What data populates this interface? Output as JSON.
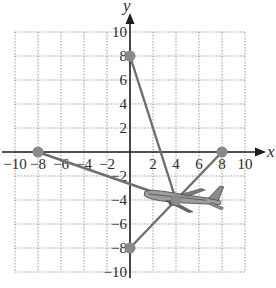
{
  "chart_data": {
    "type": "scatter",
    "title": "",
    "xlabel": "x",
    "ylabel": "y",
    "xlim": [
      -10,
      10
    ],
    "ylim": [
      -10,
      10
    ],
    "grid": true,
    "x_ticks": [
      -10,
      -8,
      -6,
      -4,
      -2,
      2,
      4,
      6,
      8,
      10
    ],
    "y_ticks": [
      10,
      8,
      6,
      4,
      2,
      -2,
      -4,
      -6,
      -8,
      -10
    ],
    "x_tick_labels": [
      "-10",
      "-8",
      "-6",
      "-4",
      "-2",
      "2",
      "4",
      "6",
      "8",
      "10"
    ],
    "y_tick_labels": [
      "10",
      "8",
      "6",
      "4",
      "2",
      "-2",
      "-4",
      "-6",
      "-8",
      "-10"
    ],
    "points": [
      {
        "x": 0,
        "y": 8
      },
      {
        "x": -8,
        "y": 0
      },
      {
        "x": 8,
        "y": 0
      },
      {
        "x": 0,
        "y": -8
      },
      {
        "x": 4,
        "y": -4
      }
    ],
    "segments": [
      {
        "from": [
          0,
          8
        ],
        "to": [
          4,
          -4
        ]
      },
      {
        "from": [
          -8,
          0
        ],
        "to": [
          4,
          -4
        ]
      },
      {
        "from": [
          8,
          0
        ],
        "to": [
          4,
          -4
        ]
      },
      {
        "from": [
          0,
          -8
        ],
        "to": [
          4,
          -4
        ]
      }
    ],
    "annotations": [
      {
        "type": "airplane-image",
        "at": [
          4,
          -4
        ]
      }
    ]
  },
  "labels": {
    "x_axis": "x",
    "y_axis": "y"
  },
  "colors": {
    "grid": "#9a9a9a",
    "axis": "#1e1e1e",
    "segment": "#6e6e6e",
    "point": "#8a8a8a",
    "text": "#2b2b2b"
  }
}
